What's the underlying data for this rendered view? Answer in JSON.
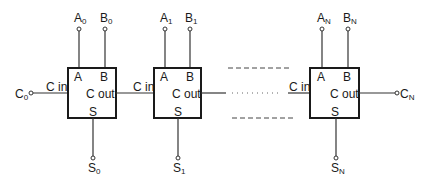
{
  "diagram": {
    "adders": [
      {
        "id": "adder-0",
        "pins": {
          "a": "A",
          "b": "B",
          "cin": "C in",
          "cout": "C out",
          "s": "S"
        },
        "inputs": {
          "a_main": "A",
          "a_sub": "0",
          "b_main": "B",
          "b_sub": "0"
        },
        "carry_in": {
          "main": "C",
          "sub": "0"
        },
        "sum": {
          "main": "S",
          "sub": "0"
        }
      },
      {
        "id": "adder-1",
        "pins": {
          "a": "A",
          "b": "B",
          "cin": "C in",
          "cout": "C out",
          "s": "S"
        },
        "inputs": {
          "a_main": "A",
          "a_sub": "1",
          "b_main": "B",
          "b_sub": "1"
        },
        "sum": {
          "main": "S",
          "sub": "1"
        }
      },
      {
        "id": "adder-N",
        "pins": {
          "a": "A",
          "b": "B",
          "cin": "C in",
          "cout": "C out",
          "s": "S"
        },
        "inputs": {
          "a_main": "A",
          "a_sub": "N",
          "b_main": "B",
          "b_sub": "N"
        },
        "carry_out": {
          "main": "C",
          "sub": "N"
        },
        "sum": {
          "main": "S",
          "sub": "N"
        }
      }
    ],
    "colors": {
      "line": "#333333",
      "box": "#1a1a1a",
      "background": "#ffffff"
    }
  }
}
